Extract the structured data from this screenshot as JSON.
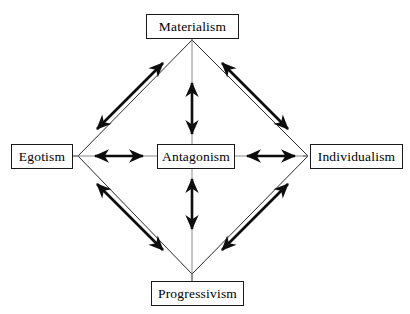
{
  "diagram": {
    "colors": {
      "outline": "#2b2b2b",
      "arrow": "#0d0d0d",
      "box_border": "#1a1a1a",
      "background": "#ffffff",
      "text": "#000000"
    },
    "nodes": {
      "top": {
        "label": "Materialism",
        "x": 192,
        "y": 26
      },
      "left": {
        "label": "Egotism",
        "x": 42,
        "y": 156
      },
      "center": {
        "label": "Antagonism",
        "x": 196,
        "y": 156
      },
      "right": {
        "label": "Individualism",
        "x": 356,
        "y": 156
      },
      "bottom": {
        "label": "Progressivism",
        "x": 197,
        "y": 293
      }
    },
    "diamond": {
      "vertices": {
        "top": {
          "x": 192,
          "y": 40
        },
        "left": {
          "x": 78,
          "y": 156
        },
        "right": {
          "x": 308,
          "y": 156
        },
        "bottom": {
          "x": 192,
          "y": 274
        }
      },
      "stroke_width": 1
    },
    "arrows": [
      {
        "name": "center-to-top",
        "kind": "vertical",
        "double_headed": true,
        "from": {
          "x": 192,
          "y": 134
        },
        "to": {
          "x": 192,
          "y": 83
        }
      },
      {
        "name": "center-to-bottom",
        "kind": "vertical",
        "double_headed": true,
        "from": {
          "x": 192,
          "y": 179
        },
        "to": {
          "x": 192,
          "y": 229
        }
      },
      {
        "name": "center-to-left",
        "kind": "horizontal",
        "double_headed": true,
        "from": {
          "x": 143,
          "y": 156
        },
        "to": {
          "x": 95,
          "y": 156
        }
      },
      {
        "name": "center-to-right",
        "kind": "horizontal",
        "double_headed": true,
        "from": {
          "x": 247,
          "y": 156
        },
        "to": {
          "x": 295,
          "y": 156
        }
      },
      {
        "name": "top-left-diagonal",
        "kind": "diagonal",
        "double_headed": true,
        "from": {
          "x": 163,
          "y": 63
        },
        "to": {
          "x": 97,
          "y": 129
        }
      },
      {
        "name": "top-right-diagonal",
        "kind": "diagonal",
        "double_headed": true,
        "from": {
          "x": 222,
          "y": 63
        },
        "to": {
          "x": 288,
          "y": 129
        }
      },
      {
        "name": "bottom-left-diagonal",
        "kind": "diagonal",
        "double_headed": true,
        "from": {
          "x": 97,
          "y": 184
        },
        "to": {
          "x": 163,
          "y": 250
        }
      },
      {
        "name": "bottom-right-diagonal",
        "kind": "diagonal",
        "double_headed": true,
        "from": {
          "x": 288,
          "y": 184
        },
        "to": {
          "x": 222,
          "y": 250
        }
      }
    ]
  }
}
